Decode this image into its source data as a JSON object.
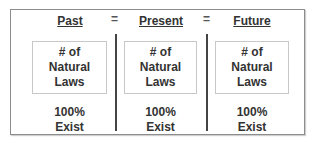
{
  "columns": [
    {
      "header": "Past",
      "box_lines": [
        "# of",
        "Natural",
        "Laws"
      ],
      "footer_lines": [
        "100%",
        "Exist"
      ]
    },
    {
      "header": "Present",
      "box_lines": [
        "# of",
        "Natural",
        "Laws"
      ],
      "footer_lines": [
        "100%",
        "Exist"
      ]
    },
    {
      "header": "Future",
      "box_lines": [
        "# of",
        "Natural",
        "Laws"
      ],
      "footer_lines": [
        "100%",
        "Exist"
      ]
    }
  ],
  "operators": [
    "=",
    "="
  ],
  "colors": {
    "text": "#333333",
    "frame": "#8c8c8c",
    "divider": "#444444",
    "box_border": "#c8c8c8"
  }
}
